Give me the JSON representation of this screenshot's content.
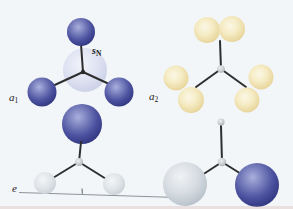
{
  "figure": {
    "background_color": "#f3f6f8",
    "labels": {
      "sN": {
        "base": "s",
        "sub": "N"
      },
      "a1": {
        "base": "a",
        "sub": "1"
      },
      "a2": {
        "base": "a",
        "sub": "2"
      },
      "e": {
        "base": "e",
        "sub": ""
      }
    },
    "colors": {
      "blue_orbital": "#4b519f",
      "blue_orbital_highlight": "#aab0dd",
      "blue_orbital_edge": "#2b3072",
      "pale_yellow_orbital": "#f0e4ba",
      "pale_yellow_edge": "#d3ba74",
      "silver_orbital": "#ccd4db",
      "small_gray_orbital": "#dde1e6",
      "central_atom_sphere": "#d8dcee",
      "junction_node": "#c2c5c8",
      "bond": "#2e2e2e",
      "baseline": "#8d939a",
      "label_text": "#222222"
    }
  }
}
